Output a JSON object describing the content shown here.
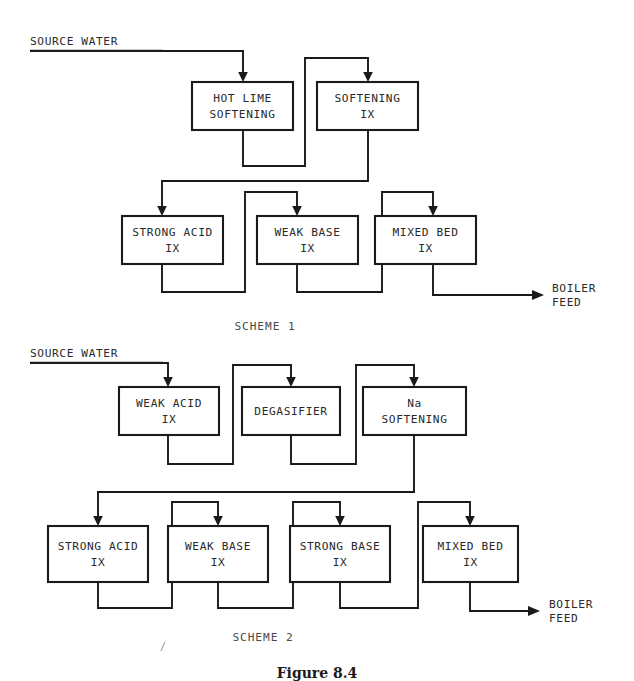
{
  "figure": {
    "caption_partial": "Figure 8.4",
    "stray_mark": "/"
  },
  "schemes": [
    {
      "id": "scheme-1",
      "label": "SCHEME 1",
      "source_label": "SOURCE WATER",
      "output_label_line1": "BOILER",
      "output_label_line2": "FEED",
      "row1": [
        {
          "name": "hot-lime-softening",
          "line1": "HOT LIME",
          "line2": "SOFTENING"
        },
        {
          "name": "softening-ix",
          "line1": "SOFTENING",
          "line2": "IX"
        }
      ],
      "row2": [
        {
          "name": "strong-acid-ix",
          "line1": "STRONG ACID",
          "line2": "IX"
        },
        {
          "name": "weak-base-ix",
          "line1": "WEAK BASE",
          "line2": "IX"
        },
        {
          "name": "mixed-bed-ix",
          "line1": "MIXED BED",
          "line2": "IX"
        }
      ]
    },
    {
      "id": "scheme-2",
      "label": "SCHEME 2",
      "source_label": "SOURCE WATER",
      "output_label_line1": "BOILER",
      "output_label_line2": "FEED",
      "row1": [
        {
          "name": "weak-acid-ix",
          "line1": "WEAK ACID",
          "line2": "IX"
        },
        {
          "name": "degasifier",
          "line1": "DEGASIFIER",
          "line2": ""
        },
        {
          "name": "na-softening",
          "line1": "Na",
          "line2": "SOFTENING"
        }
      ],
      "row2": [
        {
          "name": "strong-acid-ix",
          "line1": "STRONG ACID",
          "line2": "IX"
        },
        {
          "name": "weak-base-ix",
          "line1": "WEAK BASE",
          "line2": "IX"
        },
        {
          "name": "strong-base-ix",
          "line1": "STRONG BASE",
          "line2": "IX"
        },
        {
          "name": "mixed-bed-ix",
          "line1": "MIXED BED",
          "line2": "IX"
        }
      ]
    }
  ],
  "colors": {
    "line": "#1a1a1a",
    "text": "#2a2a2a",
    "background": "#ffffff"
  }
}
